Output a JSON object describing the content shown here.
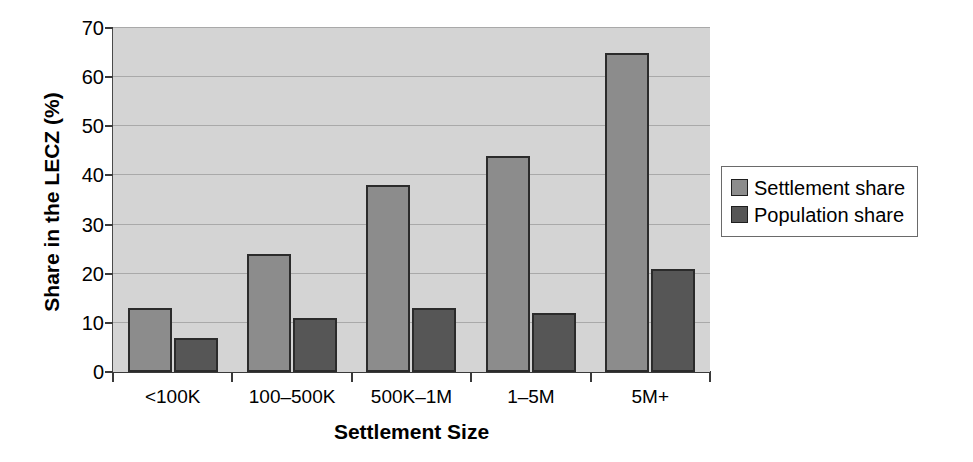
{
  "chart_data": {
    "type": "bar",
    "title": "",
    "xlabel": "Settlement Size",
    "ylabel": "Share in the LECZ (%)",
    "categories": [
      "<100K",
      "100–500K",
      "500K–1M",
      "1–5M",
      "5M+"
    ],
    "series": [
      {
        "name": "Settlement share",
        "values": [
          13,
          24,
          38,
          44,
          65
        ],
        "color": "#8c8c8c"
      },
      {
        "name": "Population share",
        "values": [
          7,
          11,
          13,
          12,
          21
        ],
        "color": "#565656"
      }
    ],
    "ylim": [
      0,
      70
    ],
    "yticks": [
      0,
      10,
      20,
      30,
      40,
      50,
      60,
      70
    ],
    "ytick_labels": [
      "0",
      "10",
      "20",
      "30",
      "40",
      "50",
      "60",
      "70"
    ],
    "grid": true,
    "legend_position": "right",
    "plot_background": "#d4d4d4",
    "bar_border_color": "#2b2b2b",
    "gridline_color": "#a9a9a9"
  },
  "legend": {
    "items": [
      {
        "label": "Settlement share",
        "color": "#8c8c8c"
      },
      {
        "label": "Population share",
        "color": "#565656"
      }
    ]
  }
}
